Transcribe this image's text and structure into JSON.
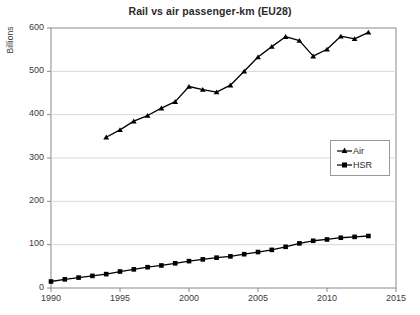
{
  "chart_data": {
    "type": "line",
    "title": "Rail vs air passenger-km (EU28)",
    "xlabel": "",
    "ylabel": "Billions",
    "xlim": [
      1990,
      2015
    ],
    "ylim": [
      0,
      600
    ],
    "xticks": [
      1990,
      1995,
      2000,
      2005,
      2010,
      2015
    ],
    "yticks": [
      0,
      100,
      200,
      300,
      400,
      500,
      600
    ],
    "grid": "horizontal",
    "legend_position": "center-right",
    "series": [
      {
        "name": "Air",
        "marker": "triangle",
        "color": "#000000",
        "x": [
          1994,
          1995,
          1996,
          1997,
          1998,
          1999,
          2000,
          2001,
          2002,
          2003,
          2004,
          2005,
          2006,
          2007,
          2008,
          2009,
          2010,
          2011,
          2012,
          2013
        ],
        "values": [
          348,
          365,
          385,
          398,
          415,
          430,
          465,
          458,
          452,
          468,
          500,
          533,
          557,
          580,
          571,
          535,
          551,
          581,
          575,
          590
        ]
      },
      {
        "name": "HSR",
        "marker": "square",
        "color": "#000000",
        "x": [
          1990,
          1991,
          1992,
          1993,
          1994,
          1995,
          1996,
          1997,
          1998,
          1999,
          2000,
          2001,
          2002,
          2003,
          2004,
          2005,
          2006,
          2007,
          2008,
          2009,
          2010,
          2011,
          2012,
          2013
        ],
        "values": [
          15,
          20,
          24,
          28,
          32,
          38,
          43,
          48,
          52,
          57,
          62,
          66,
          70,
          73,
          78,
          83,
          88,
          95,
          103,
          109,
          112,
          116,
          118,
          120
        ]
      }
    ]
  },
  "axis": {
    "y_tick_labels": [
      "600",
      "500",
      "400",
      "300",
      "200",
      "100",
      "0"
    ],
    "x_tick_labels": [
      "1990",
      "1995",
      "2000",
      "2005",
      "2010",
      "2015"
    ],
    "y_title": "Billions"
  },
  "legend": {
    "items": [
      {
        "label": "Air",
        "marker": "triangle-marker"
      },
      {
        "label": "HSR",
        "marker": "square-marker"
      }
    ]
  },
  "colors": {
    "series": "#000000",
    "gridline": "#d8d8d8",
    "axis": "#8a8a8a",
    "text": "#2b2b2b",
    "background": "#ffffff"
  }
}
